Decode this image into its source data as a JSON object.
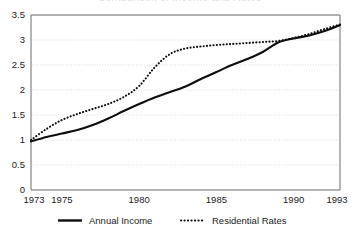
{
  "figure": {
    "title_clipped": "Comparison of Income and Rates",
    "width": 359,
    "height": 235
  },
  "chart_data": {
    "type": "line",
    "title": "",
    "xlabel": "",
    "ylabel": "",
    "xlim": [
      1973,
      1993
    ],
    "ylim": [
      0,
      3.5
    ],
    "grid": true,
    "legend_position": "bottom",
    "y_ticks": [
      "0",
      "0.5",
      "1",
      "1.5",
      "2",
      "2.5",
      "3",
      "3.5"
    ],
    "y_tick_values": [
      0,
      0.5,
      1,
      1.5,
      2,
      2.5,
      3,
      3.5
    ],
    "x_ticks": [
      "1973",
      "1975",
      "1980",
      "1985",
      "1990",
      "1993"
    ],
    "x_tick_values": [
      1973,
      1975,
      1980,
      1985,
      1990,
      1993
    ],
    "x": [
      1973,
      1974,
      1975,
      1976,
      1977,
      1978,
      1979,
      1980,
      1981,
      1982,
      1983,
      1984,
      1985,
      1986,
      1987,
      1988,
      1989,
      1990,
      1991,
      1992,
      1993
    ],
    "series": [
      {
        "name": "Annual Income",
        "style": "solid",
        "color": "#0d0d0d",
        "values": [
          0.97,
          1.06,
          1.13,
          1.2,
          1.3,
          1.43,
          1.58,
          1.72,
          1.85,
          1.96,
          2.07,
          2.22,
          2.36,
          2.5,
          2.62,
          2.76,
          2.95,
          3.03,
          3.09,
          3.18,
          3.3
        ]
      },
      {
        "name": "Residential Rates",
        "style": "dotted",
        "color": "#0d0d0d",
        "values": [
          1.0,
          1.22,
          1.4,
          1.52,
          1.62,
          1.72,
          1.86,
          2.08,
          2.45,
          2.72,
          2.83,
          2.87,
          2.9,
          2.92,
          2.94,
          2.96,
          2.98,
          3.04,
          3.12,
          3.22,
          3.31
        ]
      }
    ]
  },
  "legend": {
    "items": [
      {
        "label": "Annual Income",
        "style": "solid"
      },
      {
        "label": "Residential Rates",
        "style": "dotted"
      }
    ]
  }
}
